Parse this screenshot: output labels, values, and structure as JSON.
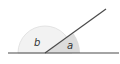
{
  "diagram": {
    "type": "supplementary-angles",
    "labels": {
      "angle_b": "b",
      "angle_a": "a"
    },
    "colors": {
      "line": "#4a4a4a",
      "arc_b_fill": "#f2f2f2",
      "arc_b_stroke": "#dddddd",
      "arc_a_fill": "#dcdcdc"
    }
  }
}
